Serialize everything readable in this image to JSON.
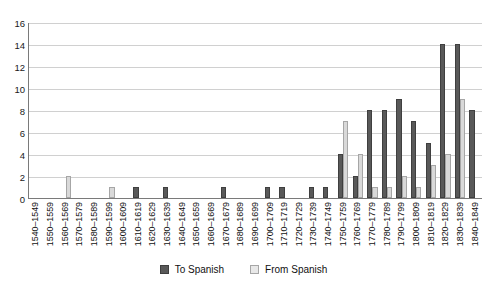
{
  "chart_data": {
    "type": "bar",
    "title": "",
    "subtitle": "",
    "xlabel": "",
    "ylabel": "",
    "ylim": [
      0,
      16
    ],
    "ytick_step": 2,
    "yticks": [
      0,
      2,
      4,
      6,
      8,
      10,
      12,
      14,
      16
    ],
    "grid": true,
    "legend_position": "bottom",
    "categories": [
      "1540–1549",
      "1550–1559",
      "1560–1569",
      "1570–1579",
      "1580–1589",
      "1590–1599",
      "1600–1609",
      "1610–1619",
      "1620–1629",
      "1630–1639",
      "1640–1649",
      "1650–1659",
      "1660–1669",
      "1670–1679",
      "1680–1689",
      "1690–1699",
      "1700–1709",
      "1710–1719",
      "1720–1729",
      "1730–1739",
      "1740–1749",
      "1750–1759",
      "1760–1769",
      "1770–1779",
      "1780–1789",
      "1790–1799",
      "1800–1809",
      "1810–1819",
      "1820–1829",
      "1830–1839",
      "1840–1849"
    ],
    "series": [
      {
        "name": "To Spanish",
        "color": "#595959",
        "values": [
          0,
          0,
          0,
          0,
          0,
          0,
          0,
          1,
          0,
          1,
          0,
          0,
          0,
          1,
          0,
          0,
          1,
          1,
          0,
          1,
          1,
          4,
          2,
          8,
          8,
          9,
          7,
          5,
          14,
          14,
          8
        ]
      },
      {
        "name": "From Spanish",
        "color": "#d9d9d9",
        "values": [
          0,
          0,
          2,
          0,
          0,
          1,
          0,
          0,
          0,
          0,
          0,
          0,
          0,
          0,
          0,
          0,
          0,
          0,
          0,
          0,
          0,
          7,
          4,
          1,
          1,
          2,
          1,
          3,
          4,
          9,
          0
        ]
      }
    ]
  },
  "legend": {
    "items": [
      {
        "label": "To Spanish"
      },
      {
        "label": "From Spanish"
      }
    ]
  }
}
